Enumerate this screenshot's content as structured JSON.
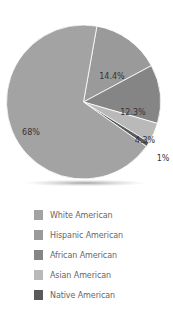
{
  "chart_data": {
    "type": "pie",
    "title": "",
    "categories": [
      "White American",
      "Hispanic American",
      "African American",
      "Asian American",
      "Native American"
    ],
    "values": [
      68,
      14.4,
      12.3,
      4.3,
      1
    ],
    "labels": [
      "68%",
      "14.4%",
      "12.3%",
      "4.3%",
      "1%"
    ],
    "colors": [
      "#a3a3a3",
      "#9a9a9a",
      "#858585",
      "#b9b9b9",
      "#5a5a5a"
    ],
    "legend_position": "bottom",
    "start": "top, clockwise from White American end"
  },
  "legend": {
    "items": [
      {
        "label": "White American",
        "color": "#a3a3a3"
      },
      {
        "label": "Hispanic American",
        "color": "#9a9a9a"
      },
      {
        "label": "African American",
        "color": "#858585"
      },
      {
        "label": "Asian American",
        "color": "#b9b9b9"
      },
      {
        "label": "Native American",
        "color": "#5a5a5a"
      }
    ]
  }
}
